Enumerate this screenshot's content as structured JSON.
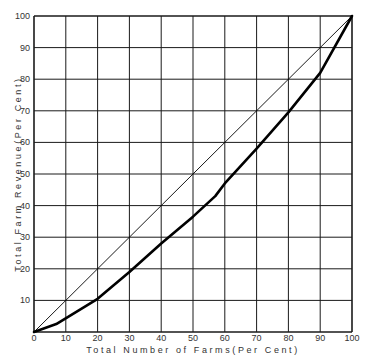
{
  "chart_data": {
    "type": "line",
    "title": "",
    "xlabel": "Total Number of Farms(Per Cent)",
    "ylabel": "Total Farm Revenue(Per Cent)",
    "xlim": [
      0,
      100
    ],
    "ylim": [
      0,
      100
    ],
    "grid": true,
    "legend": null,
    "x_ticks": [
      "0",
      "10",
      "20",
      "30",
      "40",
      "50",
      "60",
      "70",
      "80",
      "90",
      "100"
    ],
    "y_ticks": [
      "10",
      "20",
      "30",
      "40",
      "50",
      "60",
      "70",
      "80",
      "90",
      "100"
    ],
    "series": [
      {
        "name": "Line of equality",
        "style": "thin",
        "x": [
          0,
          100
        ],
        "y": [
          0,
          100
        ]
      },
      {
        "name": "Lorenz curve",
        "style": "thick",
        "x": [
          0,
          7,
          20,
          30,
          40,
          50,
          57,
          60,
          70,
          80,
          90,
          100
        ],
        "y": [
          0,
          2.5,
          10.5,
          19,
          28,
          36.5,
          43,
          47,
          58,
          69.5,
          82,
          100
        ]
      }
    ]
  },
  "colors": {
    "grid": "#1a1a1a",
    "line": "#000000",
    "text": "#333333"
  }
}
